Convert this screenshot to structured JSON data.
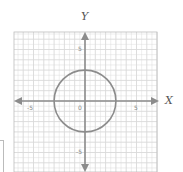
{
  "chart_data": {
    "type": "scatter",
    "title": "",
    "xlabel": "X",
    "ylabel": "Y",
    "xlim": [
      -7,
      7
    ],
    "ylim": [
      -7,
      7
    ],
    "grid": true,
    "x_ticks_labeled": [
      "-5",
      "0",
      "5"
    ],
    "y_ticks_labeled": [
      "5",
      "-5"
    ],
    "origin_label": "0",
    "shapes": [
      {
        "kind": "circle",
        "center": [
          0,
          0
        ],
        "radius": 3,
        "color": "#8c8c8c"
      }
    ],
    "axes_color": "#8c8c8c",
    "grid_color": "#d9d9d9"
  },
  "labels": {
    "x_axis": "X",
    "y_axis": "Y",
    "x_neg5": "-5",
    "x_0": "0",
    "x_5": "5",
    "y_5": "5",
    "y_neg5": "-5"
  }
}
